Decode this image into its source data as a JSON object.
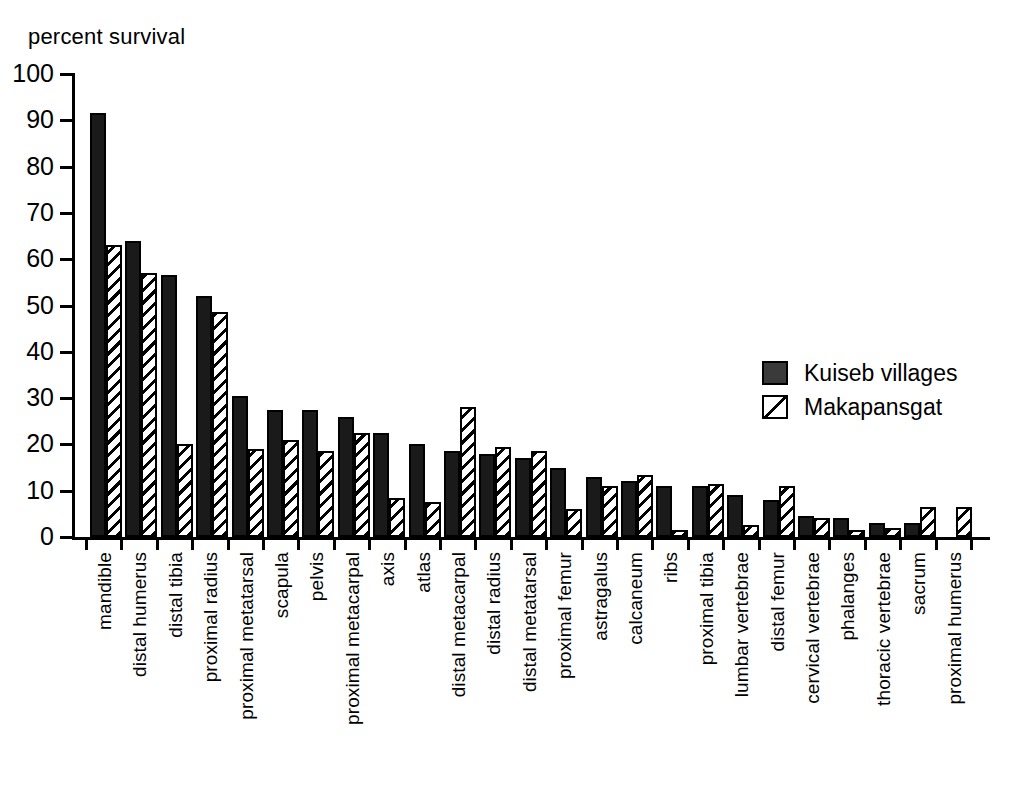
{
  "chart_data": {
    "type": "bar",
    "title": "",
    "ylabel": "percent survival",
    "xlabel": "",
    "ylim": [
      0,
      100
    ],
    "yticks": [
      0,
      10,
      20,
      30,
      40,
      50,
      60,
      70,
      80,
      90,
      100
    ],
    "grid": false,
    "legend_position": "right-middle",
    "categories": [
      "mandible",
      "distal humerus",
      "distal tibia",
      "proximal radius",
      "proximal metatarsal",
      "scapula",
      "pelvis",
      "proximal metacarpal",
      "axis",
      "atlas",
      "distal metacarpal",
      "distal radius",
      "distal metatarsal",
      "proximal femur",
      "astragalus",
      "calcaneum",
      "ribs",
      "proximal tibia",
      "lumbar vertebrae",
      "distal femur",
      "cervical vertebrae",
      "phalanges",
      "thoracic vertebrae",
      "sacrum",
      "proximal humerus"
    ],
    "series": [
      {
        "name": "Kuiseb villages",
        "pattern": "solid",
        "color": "#1a1a1a",
        "values": [
          91.5,
          64,
          56.5,
          52,
          30.5,
          27.5,
          27.5,
          26,
          22.5,
          20,
          18.5,
          18,
          17,
          15,
          13,
          12,
          11,
          11,
          9,
          8,
          4.5,
          4,
          3,
          3,
          0
        ]
      },
      {
        "name": "Makapansgat",
        "pattern": "hatched",
        "color": "#ffffff",
        "values": [
          63,
          57,
          20,
          48.5,
          19,
          21,
          18.5,
          22.5,
          8.5,
          7.5,
          28,
          19.5,
          18.5,
          6,
          11,
          13.5,
          1.5,
          11.5,
          2.5,
          11,
          4,
          1.5,
          2,
          6.5,
          6.5
        ]
      }
    ]
  },
  "legend": {
    "items": [
      {
        "label": "Kuiseb villages",
        "swatch": "solid"
      },
      {
        "label": "Makapansgat",
        "swatch": "hatch"
      }
    ]
  }
}
